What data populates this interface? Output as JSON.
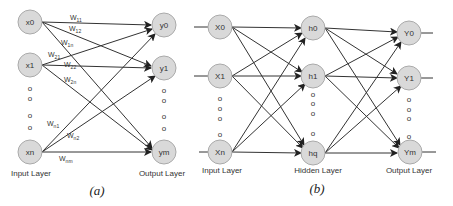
{
  "panel_a": {
    "caption": "(a)",
    "input_layer_label": "Input Layer",
    "output_layer_label": "Output Layer",
    "inputs": [
      "x0",
      "x1",
      "xn"
    ],
    "outputs": [
      "y0",
      "y1",
      "ym"
    ],
    "weights": [
      "W11",
      "W12",
      "W1n",
      "W21",
      "W22",
      "W2n",
      "Wn1",
      "Wn2",
      "Wnm"
    ],
    "ellipsis": "o"
  },
  "panel_b": {
    "caption": "(b)",
    "input_layer_label": "Input Layer",
    "hidden_layer_label": "Hidden Layer",
    "output_layer_label": "Output Layer",
    "inputs": [
      "X0",
      "X1",
      "Xn"
    ],
    "hidden": [
      "h0",
      "h1",
      "hq"
    ],
    "outputs": [
      "Y0",
      "Y1",
      "Ym"
    ],
    "ellipsis": "o"
  },
  "colors": {
    "node_fill": "#d9d9d9",
    "node_stroke": "#aaaaaa",
    "edge": "#333333"
  }
}
